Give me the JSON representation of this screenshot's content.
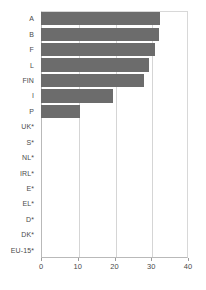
{
  "chart_data": {
    "type": "bar",
    "orientation": "horizontal",
    "title": "",
    "subtitle": "",
    "xlabel": "",
    "ylabel": "",
    "categories": [
      "A",
      "B",
      "F",
      "L",
      "FIN",
      "I",
      "P",
      "UK*",
      "S*",
      "NL*",
      "IRL*",
      "E*",
      "EL*",
      "D*",
      "DK*",
      "EU-15*"
    ],
    "values": [
      32.5,
      32,
      31,
      29.5,
      28,
      19.5,
      10.5,
      0,
      0,
      0,
      0,
      0,
      0,
      0,
      0,
      0
    ],
    "xlim": [
      0,
      40
    ],
    "xticks": [
      0,
      10,
      20,
      30,
      40
    ],
    "xtick_labels": [
      "0",
      "10",
      "20",
      "30",
      "40"
    ],
    "grid": true,
    "grid_axis": "x",
    "legend": false,
    "bar_color": "#6c6c6c",
    "grid_color": "#d5d5d5",
    "axis_color": "#b9b9b9",
    "text_color": "#4a4a4a",
    "background": "#ffffff"
  }
}
